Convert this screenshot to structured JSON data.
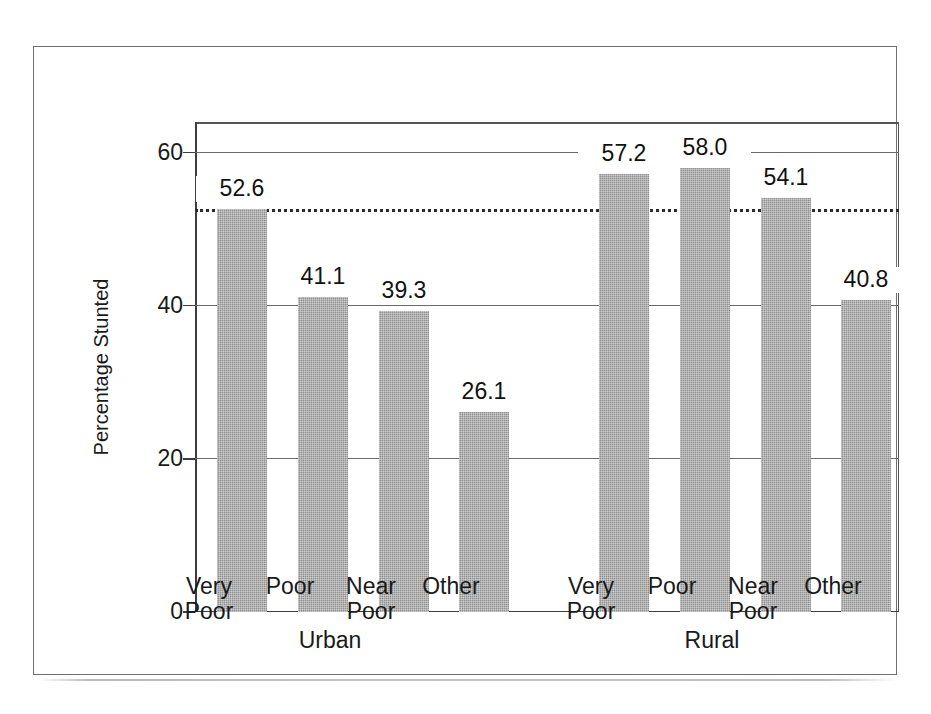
{
  "chart_data": {
    "type": "bar",
    "title": "",
    "subtitle": "",
    "xlabel": "",
    "ylabel": "Percentage Stunted",
    "ylim": [
      0,
      64
    ],
    "ytick_values": [
      0,
      20,
      40,
      60
    ],
    "ytick_labels": [
      "0",
      "20",
      "40",
      "60"
    ],
    "grid": "horizontal",
    "legend": "none",
    "categories": [
      "Very Poor",
      "Poor",
      "Near Poor",
      "Other",
      "Very Poor",
      "Poor",
      "Near Poor",
      "Other"
    ],
    "values": [
      52.6,
      41.1,
      39.3,
      26.1,
      57.2,
      58.0,
      54.1,
      40.8
    ],
    "value_labels": [
      "52.6",
      "41.1",
      "39.3",
      "26.1",
      "57.2",
      "58.0",
      "54.1",
      "40.8"
    ],
    "groups": [
      {
        "label": "Urban",
        "categories": [
          "Very Poor",
          "Poor",
          "Near Poor",
          "Other"
        ],
        "values": [
          52.6,
          41.1,
          39.3,
          26.1
        ]
      },
      {
        "label": "Rural",
        "categories": [
          "Very Poor",
          "Poor",
          "Near Poor",
          "Other"
        ],
        "values": [
          57.2,
          58.0,
          54.1,
          40.8
        ]
      }
    ],
    "annotations": [
      {
        "type": "horizontal-reference-line",
        "style": "dotted",
        "value": 52.6,
        "label": ""
      }
    ],
    "bar_color": "#8e8e8e",
    "axis_color": "#3d3d3d",
    "grid_color": "#6b6b6b",
    "frame_color": "#6f6f6f"
  },
  "axis": {
    "y_title": "Percentage Stunted",
    "ticks": [
      {
        "label": "60",
        "value": 60
      },
      {
        "label": "40",
        "value": 40
      },
      {
        "label": "20",
        "value": 20
      },
      {
        "label": "0",
        "value": 0
      }
    ]
  },
  "bars": [
    {
      "label_line1": "Very",
      "label_line2": "Poor",
      "value_label": "52.6",
      "value": 52.6,
      "group": "Urban"
    },
    {
      "label_line1": "Poor",
      "label_line2": "",
      "value_label": "41.1",
      "value": 41.1,
      "group": "Urban"
    },
    {
      "label_line1": "Near",
      "label_line2": "Poor",
      "value_label": "39.3",
      "value": 39.3,
      "group": "Urban"
    },
    {
      "label_line1": "Other",
      "label_line2": "",
      "value_label": "26.1",
      "value": 26.1,
      "group": "Urban"
    },
    {
      "label_line1": "Very",
      "label_line2": "Poor",
      "value_label": "57.2",
      "value": 57.2,
      "group": "Rural"
    },
    {
      "label_line1": "Poor",
      "label_line2": "",
      "value_label": "58.0",
      "value": 58.0,
      "group": "Rural"
    },
    {
      "label_line1": "Near",
      "label_line2": "Poor",
      "value_label": "54.1",
      "value": 54.1,
      "group": "Rural"
    },
    {
      "label_line1": "Other",
      "label_line2": "",
      "value_label": "40.8",
      "value": 40.8,
      "group": "Rural"
    }
  ],
  "groups": [
    {
      "label": "Urban"
    },
    {
      "label": "Rural"
    }
  ]
}
